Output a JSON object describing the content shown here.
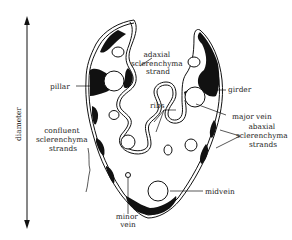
{
  "diagram": {
    "type": "labeled cross-section illustration",
    "colors": {
      "ink": "#111111",
      "background": "#ffffff",
      "text": "#222222"
    },
    "axis": {
      "label": "diameter",
      "orientation": "vertical",
      "arrows": "both ends"
    },
    "labels": {
      "adaxial": [
        "adaxial",
        "sclerenchyma",
        "strand"
      ],
      "pillar": "pillar",
      "girder": "girder",
      "ribs": "ribs",
      "major_vein": "major vein",
      "confluent": [
        "confluent",
        "sclerenchyma",
        "strands"
      ],
      "abaxial": [
        "abaxial",
        "sclerenchyma",
        "strands"
      ],
      "midvein": "midvein",
      "minor_vein": [
        "minor",
        "vein"
      ]
    }
  }
}
